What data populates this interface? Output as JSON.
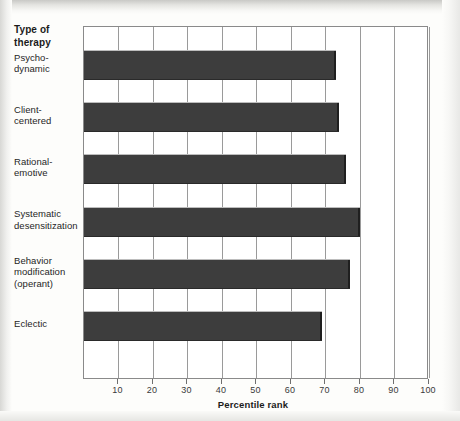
{
  "chart_data": {
    "type": "bar",
    "orientation": "horizontal",
    "title": "",
    "xlabel": "Percentile rank",
    "ylabel": "Type of therapy",
    "categories": [
      "Psycho-\ndynamic",
      "Client-\ncentered",
      "Rational-\nemotive",
      "Systematic\ndesensitization",
      "Behavior\nmodification\n(operant)",
      "Eclectic"
    ],
    "values": [
      73,
      74,
      76,
      80,
      77,
      69
    ],
    "xlim": [
      0,
      100
    ],
    "xticks": [
      10,
      20,
      30,
      40,
      50,
      60,
      70,
      80,
      90,
      100
    ],
    "xtick_labels": [
      "10",
      "20",
      "30",
      "40",
      "50",
      "60",
      "70",
      "80",
      "90",
      "100"
    ],
    "grid": true,
    "grid_axis": "x",
    "legend": false,
    "bar_color": "#3d3d3d",
    "plot_background": "#ffffff",
    "axis_color": "#8a8a8a"
  },
  "labels": {
    "y_axis_title": "Type of\ntherapy",
    "x_axis_title": "Percentile rank",
    "categories": [
      {
        "line1": "Psycho-",
        "line2": "dynamic",
        "line3": ""
      },
      {
        "line1": "Client-",
        "line2": "centered",
        "line3": ""
      },
      {
        "line1": "Rational-",
        "line2": "emotive",
        "line3": ""
      },
      {
        "line1": "Systematic",
        "line2": "desensitization",
        "line3": ""
      },
      {
        "line1": "Behavior",
        "line2": "modification",
        "line3": "(operant)"
      },
      {
        "line1": "Eclectic",
        "line2": "",
        "line3": ""
      }
    ],
    "xticks": [
      "10",
      "20",
      "30",
      "40",
      "50",
      "60",
      "70",
      "80",
      "90",
      "100"
    ]
  }
}
